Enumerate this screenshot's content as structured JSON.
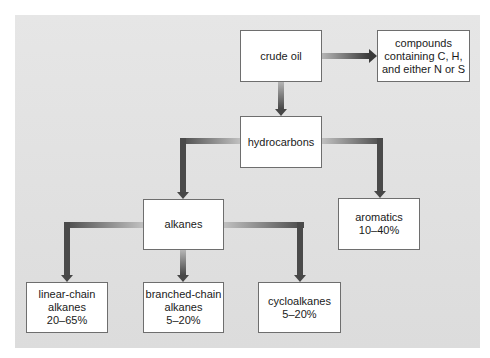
{
  "diagram": {
    "type": "flowchart",
    "colors": {
      "panel": "#e2e2e2",
      "box_fill": "#ffffff",
      "box_border": "#6e6e6e",
      "connector_dark": "#474747",
      "connector_light": "#b8b8b8"
    },
    "nodes": {
      "crude_oil": {
        "lines": [
          "crude oil"
        ]
      },
      "compounds": {
        "lines": [
          "compounds",
          "containing C, H,",
          "and either N or S"
        ]
      },
      "hydrocarbons": {
        "lines": [
          "hydrocarbons"
        ]
      },
      "alkanes": {
        "lines": [
          "alkanes"
        ]
      },
      "aromatics": {
        "lines": [
          "aromatics",
          "10–40%"
        ]
      },
      "linear": {
        "lines": [
          "linear-chain",
          "alkanes",
          "20–65%"
        ]
      },
      "branched": {
        "lines": [
          "branched-chain",
          "alkanes",
          "5–20%"
        ]
      },
      "cyclo": {
        "lines": [
          "cycloalkanes",
          "5–20%"
        ]
      }
    },
    "edges": [
      {
        "from": "crude oil",
        "to": "compounds containing C, H, and either N or S"
      },
      {
        "from": "crude oil",
        "to": "hydrocarbons"
      },
      {
        "from": "hydrocarbons",
        "to": "alkanes"
      },
      {
        "from": "hydrocarbons",
        "to": "aromatics"
      },
      {
        "from": "alkanes",
        "to": "linear-chain alkanes"
      },
      {
        "from": "alkanes",
        "to": "branched-chain alkanes"
      },
      {
        "from": "alkanes",
        "to": "cycloalkanes"
      }
    ]
  }
}
